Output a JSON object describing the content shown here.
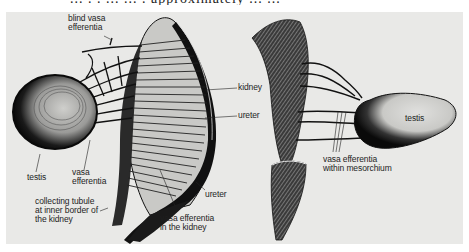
{
  "figure": {
    "top_text_fragment": "... . . ... ... . approximately ... ...",
    "background_color": "#e9e9e7",
    "ink_color": "#1e1e1e",
    "left_panel": {
      "labels": {
        "blind_vasa_efferentia": "blind vasa\nefferentia",
        "kidney": "kidney",
        "ureter_upper": "ureter",
        "testis": "testis",
        "vasa_efferentia": "vasa\nefferentia",
        "collecting_tubule": "collecting tubule\nat inner border of\nthe kidney",
        "ureter_lower": "ureter",
        "vasa_efferentia_kidney": "vasa efferentia\nin the kidney"
      }
    },
    "right_panel": {
      "labels": {
        "testis": "testis",
        "vasa_efferentia_mesorchium": "vasa efferentia\nwithin mesorchium"
      }
    }
  }
}
